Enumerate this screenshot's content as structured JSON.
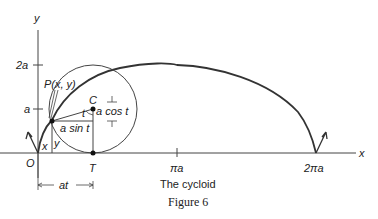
{
  "figure": {
    "caption": "The cycloid",
    "figure_label": "Figure 6"
  },
  "axes": {
    "x_label": "x",
    "y_label": "y",
    "origin_label": "O",
    "y_ticks": [
      "a",
      "2a"
    ],
    "x_ticks": [
      "πa",
      "2πa"
    ]
  },
  "annotations": {
    "point_p": "P(x, y)",
    "center_c": "C",
    "tangent_point_t": "T",
    "angle_t": "t",
    "a_sin_t": "a sin t",
    "a_cos_t": "a cos t",
    "x_seg": "x",
    "y_seg": "y",
    "at_dimension": "at"
  },
  "colors": {
    "line": "#333333",
    "background": "#ffffff"
  }
}
